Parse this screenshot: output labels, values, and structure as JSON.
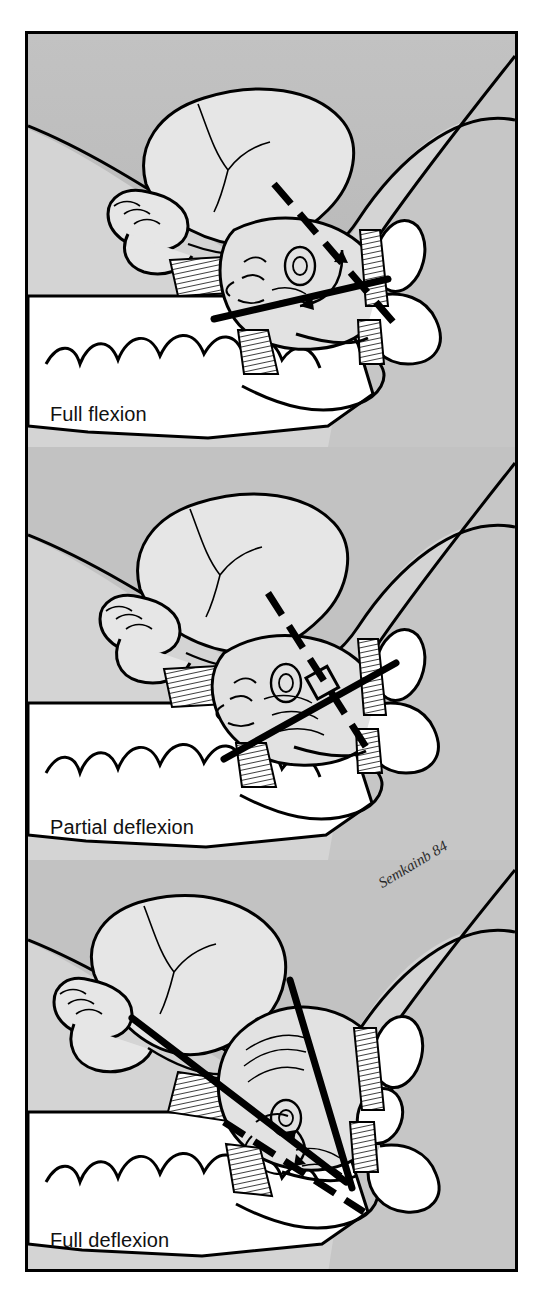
{
  "figure": {
    "kind": "medical-illustration",
    "panel_count": 3,
    "signature": "Semkainb 84",
    "colors": {
      "frame_border": "#000000",
      "ink": "#000000",
      "maternal_tissue_dark": "#bdbdbd",
      "maternal_tissue_mid": "#d2d2d2",
      "fetal_body": "#e4e4e4",
      "bone_white": "#ffffff",
      "caption_text": "#111111"
    }
  },
  "panels": [
    {
      "id": "panel-1",
      "caption": "Full flexion",
      "attitude": "full flexion",
      "solid_axis_label": "fetal anteroposterior axis",
      "dashed_axis_label": "maternal pelvic axis",
      "angle_marker": "curved-arrow",
      "presenting_diameter": "suboccipitobregmatic"
    },
    {
      "id": "panel-2",
      "caption": "Partial deflexion",
      "attitude": "partial deflexion",
      "solid_axis_label": "fetal anteroposterior axis",
      "dashed_axis_label": "maternal pelvic axis",
      "angle_marker": "right-angle-square",
      "presenting_diameter": "occipitofrontal"
    },
    {
      "id": "panel-3",
      "caption": "Full deflexion",
      "attitude": "full deflexion",
      "solid_axis_label": "fetal anteroposterior axis",
      "dashed_axis_label": "maternal pelvic axis",
      "angle_marker": "double-headed-curved-arrow",
      "presenting_diameter": "submentobregmatic"
    }
  ]
}
